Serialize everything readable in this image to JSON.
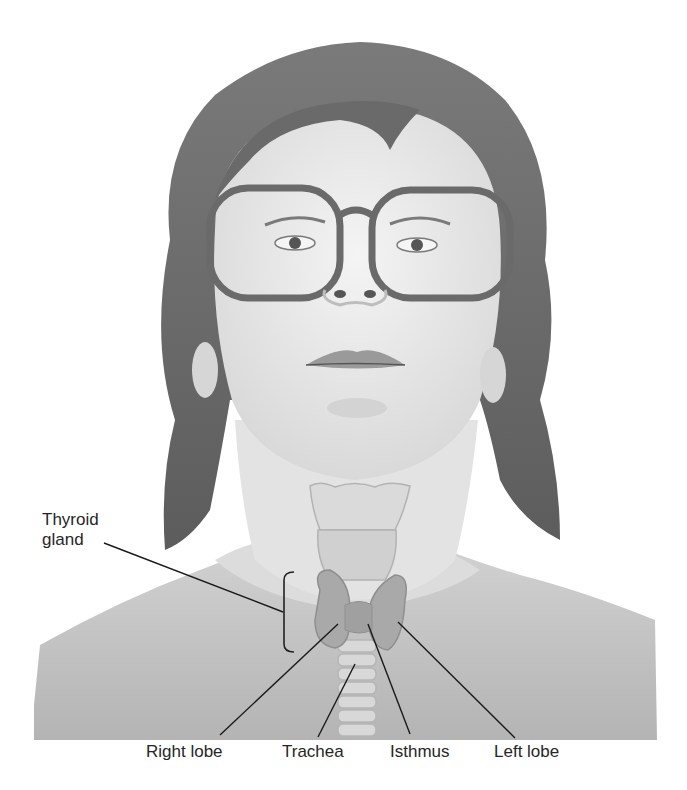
{
  "figure": {
    "labels": {
      "thyroid_gland_line1": "Thyroid",
      "thyroid_gland_line2": "gland",
      "right_lobe": "Right lobe",
      "trachea": "Trachea",
      "isthmus": "Isthmus",
      "left_lobe": "Left lobe"
    },
    "colors": {
      "background": "#ffffff",
      "skin": "#e9e9e9",
      "hair": "#6e6e6e",
      "shoulder_shade": "#bdbdbd",
      "thyroid": "#a9a9a9",
      "leader_line": "#1a1a1a",
      "label_text": "#262626"
    }
  }
}
